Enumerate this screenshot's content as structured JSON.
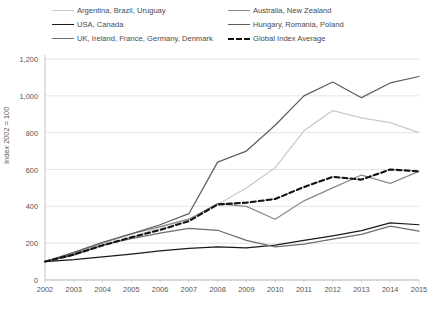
{
  "chart_data": {
    "type": "line",
    "title": "",
    "xlabel": "",
    "ylabel": "Index 2002 = 100",
    "x": [
      2002,
      2003,
      2004,
      2005,
      2006,
      2007,
      2008,
      2009,
      2010,
      2011,
      2012,
      2013,
      2014,
      2015
    ],
    "xlim": [
      2002,
      2015
    ],
    "ylim": [
      0,
      1200
    ],
    "yticks": [
      0,
      200,
      400,
      600,
      800,
      1000,
      1200
    ],
    "ytick_labels": [
      "0",
      "200",
      "400",
      "600",
      "800",
      "1,000",
      "1,200"
    ],
    "xtick_labels": [
      "2002",
      "2003",
      "2004",
      "2005",
      "2006",
      "2007",
      "2008",
      "2009",
      "2010",
      "2011",
      "2012",
      "2013",
      "2014",
      "2015"
    ],
    "grid": true,
    "legend_position": "above-plot",
    "series": [
      {
        "name": "Argentina, Brazil, Uruguay",
        "color": "#c9c9c9",
        "style": "solid",
        "values": [
          100,
          140,
          185,
          230,
          285,
          330,
          410,
          500,
          610,
          810,
          920,
          880,
          855,
          800
        ]
      },
      {
        "name": "USA,  Canada",
        "color": "#1a1a1a",
        "style": "solid",
        "values": [
          100,
          110,
          125,
          140,
          158,
          172,
          180,
          175,
          190,
          215,
          240,
          268,
          310,
          300
        ]
      },
      {
        "name": "UK, Ireland, France, Germany, Denmark",
        "color": "#6e6e6e",
        "style": "solid",
        "values": [
          100,
          135,
          190,
          225,
          255,
          280,
          270,
          215,
          180,
          195,
          222,
          248,
          292,
          265
        ]
      },
      {
        "name": "Australia, New Zealand",
        "color": "#8a8a8a",
        "style": "solid",
        "values": [
          100,
          145,
          200,
          250,
          290,
          330,
          415,
          400,
          330,
          430,
          500,
          570,
          525,
          590
        ]
      },
      {
        "name": "Hungary, Romania, Poland",
        "color": "#5e5e5e",
        "style": "solid",
        "values": [
          100,
          150,
          205,
          250,
          300,
          360,
          640,
          700,
          840,
          1000,
          1075,
          990,
          1070,
          1105
        ]
      },
      {
        "name": "Global Index Average",
        "color": "#111111",
        "style": "dashed",
        "values": [
          100,
          138,
          188,
          232,
          272,
          320,
          410,
          420,
          440,
          505,
          560,
          545,
          600,
          590
        ]
      }
    ]
  },
  "axes": {
    "y_axis_title": "Index 2002 = 100"
  }
}
